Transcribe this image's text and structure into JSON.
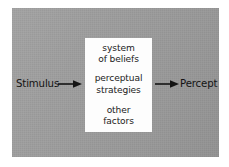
{
  "diagram": {
    "background_color": "#ffffff",
    "panel_color": "#9e9e9e",
    "box_color": "#fdfdfd",
    "ink_color": "#141414",
    "input": {
      "label": "Stimulus",
      "arrow": "arrow-right"
    },
    "output": {
      "label": "Percept",
      "arrow": "arrow-right"
    },
    "box": {
      "groups": [
        {
          "id": "beliefs",
          "lines": [
            "system",
            "of beliefs"
          ]
        },
        {
          "id": "strategies",
          "lines": [
            "perceptual",
            "strategies"
          ]
        },
        {
          "id": "factors",
          "lines": [
            "other",
            "factors"
          ]
        }
      ]
    }
  }
}
